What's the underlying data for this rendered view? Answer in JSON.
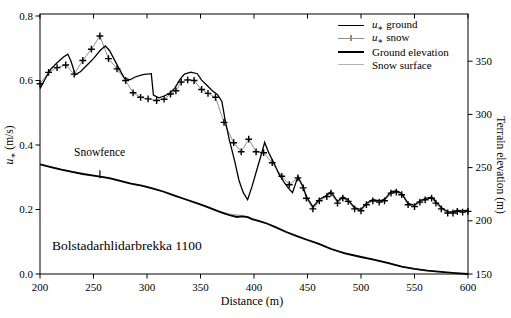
{
  "figure": {
    "station_label": "Bolstadarhlidarbrekka 1100",
    "annotation": {
      "label": "Snowfence",
      "x_m": 256
    }
  },
  "chart_data": {
    "type": "line",
    "title": "",
    "xlabel": "Distance (m)",
    "ylabel_left": "u* (m/s)",
    "ylabel_right": "Terrain elevation (m)",
    "xlim": [
      200,
      600
    ],
    "ylim_left": [
      0,
      0.8
    ],
    "ylim_right": [
      150,
      395
    ],
    "x_ticks": [
      200,
      250,
      300,
      350,
      400,
      450,
      500,
      550,
      600
    ],
    "y_ticks_left": [
      "0.0",
      "0.2",
      "0.4",
      "0.6",
      "0.8"
    ],
    "y_ticks_right": [
      150,
      200,
      250,
      300,
      350
    ],
    "grid": false,
    "icons": {
      "snow_marker": "+"
    },
    "colors": {
      "line": "#000000",
      "snow_surface": "#b3b3b3",
      "snow_connector": "#909090",
      "background": "#ffffff"
    },
    "legend": {
      "position": "top-right",
      "entries": [
        {
          "label": "u* ground",
          "style": "thin-black-line"
        },
        {
          "label": "u* snow",
          "style": "plus-markers-on-thin-line"
        },
        {
          "label": "Ground elevation",
          "style": "thick-black-line"
        },
        {
          "label": "Snow surface",
          "style": "thin-gray-line"
        }
      ]
    },
    "series": [
      {
        "name": "u* ground",
        "axis": "left",
        "type": "line",
        "points": [
          [
            200,
            0.575
          ],
          [
            204,
            0.6
          ],
          [
            210,
            0.635
          ],
          [
            216,
            0.655
          ],
          [
            222,
            0.673
          ],
          [
            226,
            0.682
          ],
          [
            229,
            0.66
          ],
          [
            233,
            0.618
          ],
          [
            238,
            0.628
          ],
          [
            244,
            0.648
          ],
          [
            250,
            0.668
          ],
          [
            256,
            0.692
          ],
          [
            261,
            0.707
          ],
          [
            265,
            0.693
          ],
          [
            269,
            0.668
          ],
          [
            274,
            0.636
          ],
          [
            279,
            0.607
          ],
          [
            284,
            0.602
          ],
          [
            289,
            0.611
          ],
          [
            296,
            0.618
          ],
          [
            304,
            0.621
          ],
          [
            306,
            0.555
          ],
          [
            311,
            0.546
          ],
          [
            316,
            0.552
          ],
          [
            321,
            0.56
          ],
          [
            326,
            0.576
          ],
          [
            331,
            0.604
          ],
          [
            335,
            0.62
          ],
          [
            341,
            0.626
          ],
          [
            347,
            0.621
          ],
          [
            351,
            0.601
          ],
          [
            356,
            0.585
          ],
          [
            361,
            0.568
          ],
          [
            366,
            0.556
          ],
          [
            370,
            0.535
          ],
          [
            373,
            0.478
          ],
          [
            377,
            0.415
          ],
          [
            382,
            0.35
          ],
          [
            386,
            0.29
          ],
          [
            390,
            0.252
          ],
          [
            394,
            0.23
          ],
          [
            398,
            0.27
          ],
          [
            403,
            0.327
          ],
          [
            407,
            0.373
          ],
          [
            410,
            0.408
          ],
          [
            414,
            0.374
          ],
          [
            419,
            0.342
          ],
          [
            423,
            0.312
          ],
          [
            428,
            0.285
          ],
          [
            432,
            0.267
          ],
          [
            436,
            0.252
          ],
          [
            441,
            0.302
          ],
          [
            446,
            0.27
          ],
          [
            449,
            0.24
          ],
          [
            455,
            0.208
          ],
          [
            461,
            0.231
          ],
          [
            468,
            0.244
          ],
          [
            472,
            0.255
          ],
          [
            478,
            0.225
          ],
          [
            483,
            0.239
          ],
          [
            488,
            0.229
          ],
          [
            494,
            0.206
          ],
          [
            500,
            0.2
          ],
          [
            505,
            0.219
          ],
          [
            511,
            0.231
          ],
          [
            517,
            0.227
          ],
          [
            522,
            0.231
          ],
          [
            528,
            0.255
          ],
          [
            533,
            0.258
          ],
          [
            538,
            0.25
          ],
          [
            544,
            0.219
          ],
          [
            550,
            0.213
          ],
          [
            555,
            0.227
          ],
          [
            560,
            0.234
          ],
          [
            566,
            0.239
          ],
          [
            570,
            0.224
          ],
          [
            575,
            0.206
          ],
          [
            581,
            0.193
          ],
          [
            586,
            0.193
          ],
          [
            590,
            0.198
          ],
          [
            595,
            0.196
          ],
          [
            600,
            0.198
          ]
        ]
      },
      {
        "name": "u* snow",
        "axis": "left",
        "type": "line+marker",
        "marker": "+",
        "points": [
          [
            200,
            0.59
          ],
          [
            208,
            0.625
          ],
          [
            216,
            0.64
          ],
          [
            224,
            0.648
          ],
          [
            232,
            0.62
          ],
          [
            240,
            0.662
          ],
          [
            248,
            0.697
          ],
          [
            256,
            0.738
          ],
          [
            264,
            0.668
          ],
          [
            272,
            0.636
          ],
          [
            280,
            0.6
          ],
          [
            287,
            0.562
          ],
          [
            294,
            0.548
          ],
          [
            301,
            0.543
          ],
          [
            309,
            0.538
          ],
          [
            316,
            0.542
          ],
          [
            322,
            0.558
          ],
          [
            327,
            0.568
          ],
          [
            332,
            0.595
          ],
          [
            338,
            0.602
          ],
          [
            344,
            0.6
          ],
          [
            351,
            0.572
          ],
          [
            357,
            0.56
          ],
          [
            364,
            0.548
          ],
          [
            372,
            0.47
          ],
          [
            381,
            0.407
          ],
          [
            388,
            0.379
          ],
          [
            395,
            0.418
          ],
          [
            402,
            0.379
          ],
          [
            409,
            0.376
          ],
          [
            417,
            0.345
          ],
          [
            426,
            0.303
          ],
          [
            433,
            0.277
          ],
          [
            441,
            0.298
          ],
          [
            446,
            0.267
          ],
          [
            449,
            0.235
          ],
          [
            455,
            0.202
          ],
          [
            461,
            0.227
          ],
          [
            468,
            0.24
          ],
          [
            472,
            0.251
          ],
          [
            478,
            0.22
          ],
          [
            483,
            0.235
          ],
          [
            488,
            0.225
          ],
          [
            494,
            0.202
          ],
          [
            500,
            0.196
          ],
          [
            505,
            0.215
          ],
          [
            511,
            0.227
          ],
          [
            517,
            0.223
          ],
          [
            522,
            0.227
          ],
          [
            528,
            0.251
          ],
          [
            533,
            0.254
          ],
          [
            538,
            0.246
          ],
          [
            544,
            0.215
          ],
          [
            550,
            0.209
          ],
          [
            555,
            0.223
          ],
          [
            560,
            0.23
          ],
          [
            566,
            0.235
          ],
          [
            570,
            0.22
          ],
          [
            575,
            0.202
          ],
          [
            581,
            0.189
          ],
          [
            586,
            0.189
          ],
          [
            590,
            0.194
          ],
          [
            595,
            0.192
          ],
          [
            600,
            0.194
          ]
        ]
      },
      {
        "name": "Ground elevation",
        "axis": "right",
        "type": "line",
        "points": [
          [
            200,
            253
          ],
          [
            210,
            250.5
          ],
          [
            220,
            248
          ],
          [
            230,
            246
          ],
          [
            240,
            244
          ],
          [
            250,
            242.5
          ],
          [
            256,
            241.5
          ],
          [
            265,
            240
          ],
          [
            275,
            237.5
          ],
          [
            285,
            235
          ],
          [
            295,
            233
          ],
          [
            305,
            230.5
          ],
          [
            315,
            227.5
          ],
          [
            325,
            224
          ],
          [
            335,
            220.5
          ],
          [
            345,
            217
          ],
          [
            355,
            213.5
          ],
          [
            365,
            209.5
          ],
          [
            372,
            207
          ],
          [
            378,
            205
          ],
          [
            384,
            203.6
          ],
          [
            389,
            204.2
          ],
          [
            394,
            203.4
          ],
          [
            398,
            201.6
          ],
          [
            404,
            200
          ],
          [
            412,
            197.5
          ],
          [
            420,
            194
          ],
          [
            430,
            189.5
          ],
          [
            440,
            185.5
          ],
          [
            450,
            182
          ],
          [
            460,
            178.5
          ],
          [
            472,
            173.5
          ],
          [
            485,
            169.5
          ],
          [
            500,
            166
          ],
          [
            512,
            163.5
          ],
          [
            525,
            160.5
          ],
          [
            538,
            157
          ],
          [
            550,
            154.8
          ],
          [
            562,
            153.2
          ],
          [
            575,
            152
          ],
          [
            588,
            150.8
          ],
          [
            600,
            150
          ]
        ]
      },
      {
        "name": "Snow surface",
        "axis": "right",
        "type": "line",
        "points": [
          [
            200,
            253.3
          ],
          [
            220,
            248.3
          ],
          [
            240,
            244.3
          ],
          [
            260,
            241
          ],
          [
            280,
            236
          ],
          [
            300,
            232
          ],
          [
            320,
            226
          ],
          [
            340,
            219
          ],
          [
            360,
            211.5
          ],
          [
            370,
            208
          ],
          [
            378,
            206.3
          ],
          [
            386,
            205.3
          ],
          [
            394,
            203.8
          ],
          [
            400,
            201.5
          ],
          [
            410,
            198.3
          ],
          [
            420,
            194.3
          ],
          [
            430,
            189.8
          ],
          [
            445,
            184
          ],
          [
            460,
            178.7
          ],
          [
            480,
            171
          ],
          [
            500,
            166.2
          ],
          [
            520,
            161.2
          ],
          [
            540,
            156.5
          ],
          [
            560,
            153.4
          ],
          [
            580,
            151.3
          ],
          [
            600,
            150.1
          ]
        ]
      }
    ]
  }
}
